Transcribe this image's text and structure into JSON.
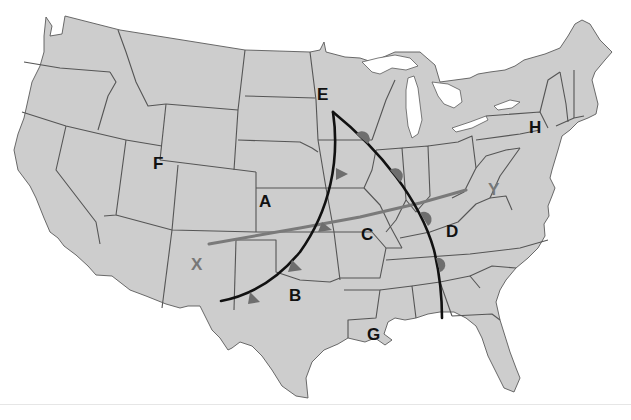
{
  "map": {
    "title": "United States weather map",
    "colors": {
      "land": "#cdcdcd",
      "borders": "#5a5a5a",
      "fronts": "#111111",
      "cross_section_line": "#7a7a7a",
      "front_symbols": "#6e6e6e",
      "background": "#ffffff"
    },
    "labels": [
      {
        "id": "A",
        "text": "A",
        "x": 266,
        "y": 207,
        "color": "black"
      },
      {
        "id": "B",
        "text": "B",
        "x": 296,
        "y": 301,
        "color": "black"
      },
      {
        "id": "C",
        "text": "C",
        "x": 368,
        "y": 239,
        "color": "black"
      },
      {
        "id": "D",
        "text": "D",
        "x": 453,
        "y": 236,
        "color": "black"
      },
      {
        "id": "E",
        "text": "E",
        "x": 323,
        "y": 99,
        "color": "black"
      },
      {
        "id": "F",
        "text": "F",
        "x": 158,
        "y": 168,
        "color": "black"
      },
      {
        "id": "G",
        "text": "G",
        "x": 374,
        "y": 339,
        "color": "black"
      },
      {
        "id": "H",
        "text": "H",
        "x": 535,
        "y": 132,
        "color": "black"
      },
      {
        "id": "X",
        "text": "X",
        "x": 197,
        "y": 269,
        "color": "gray"
      },
      {
        "id": "Y",
        "text": "Y",
        "x": 494,
        "y": 194,
        "color": "gray"
      }
    ],
    "fronts": [
      {
        "name": "cold-front-west",
        "type": "cold",
        "from": "E",
        "description": "curved front from Minnesota south-west to New Mexico"
      },
      {
        "name": "occluded-front-east",
        "type": "stationary/occluded",
        "from": "E",
        "description": "front from Minnesota south-east to Alabama"
      }
    ],
    "cross_section": {
      "from": "X",
      "to": "Y"
    }
  }
}
